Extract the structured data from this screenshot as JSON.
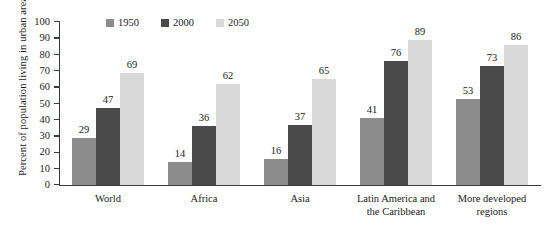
{
  "chart_data": {
    "type": "bar",
    "title": "",
    "xlabel": "",
    "ylabel": "Percent of population living in urban areas",
    "ylim": [
      0,
      100
    ],
    "yticks": [
      0,
      10,
      20,
      30,
      40,
      50,
      60,
      70,
      80,
      90,
      100
    ],
    "grid": false,
    "legend_position": "top",
    "categories": [
      "World",
      "Africa",
      "Asia",
      "Latin America and the Caribbean",
      "More developed regions"
    ],
    "category_lines": [
      [
        "World"
      ],
      [
        "Africa"
      ],
      [
        "Asia"
      ],
      [
        "Latin America and",
        "the Caribbean"
      ],
      [
        "More developed",
        "regions"
      ]
    ],
    "series": [
      {
        "name": "1950",
        "color": "#8c8c8c",
        "values": [
          29,
          14,
          16,
          41,
          53
        ]
      },
      {
        "name": "2000",
        "color": "#4a4a4a",
        "values": [
          47,
          36,
          37,
          76,
          73
        ]
      },
      {
        "name": "2050",
        "color": "#d9d9d9",
        "values": [
          69,
          62,
          65,
          89,
          86
        ]
      }
    ]
  },
  "axis": {
    "tick_labels": [
      "100",
      "90",
      "80",
      "70",
      "60",
      "50",
      "40",
      "30",
      "20",
      "10",
      "0"
    ]
  },
  "colors": {
    "axis": "#3a3a3a",
    "text": "#1a1a1a",
    "background": "#ffffff"
  }
}
